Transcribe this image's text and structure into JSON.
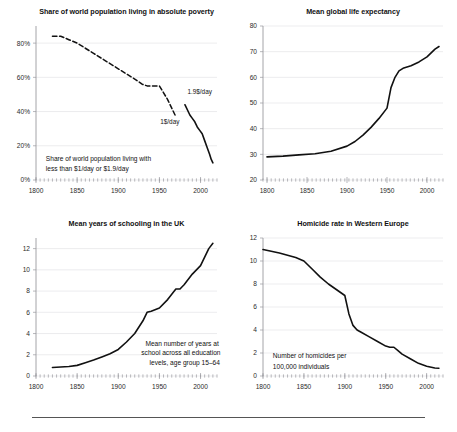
{
  "figure": {
    "name": "four-panel-progress-charts",
    "background": "#ffffff",
    "line_color": "#111111",
    "grid_color": "#d8d8dc",
    "axis_color": "#8d8d93"
  },
  "chart_data": [
    {
      "id": "poverty",
      "type": "line",
      "title": "Share of world population living in absolute poverty",
      "xlabel": "",
      "ylabel": "",
      "xlim": [
        1800,
        2020
      ],
      "ylim": [
        0,
        90
      ],
      "xticks": [
        1800,
        1850,
        1900,
        1950,
        2000
      ],
      "xtick_labels": [
        "1800",
        "1850",
        "1900",
        "1950",
        "2000"
      ],
      "yticks": [
        0,
        20,
        40,
        60,
        80
      ],
      "ytick_labels": [
        "0%",
        "20%",
        "40%",
        "60%",
        "80%"
      ],
      "grid": true,
      "legend": "none",
      "annotations": [
        {
          "text": "1.9$/day",
          "x": 1984,
          "y": 50
        },
        {
          "text": "1$/day",
          "x": 1951,
          "y": 33
        },
        {
          "text": "Share of world population living with",
          "x": 1812,
          "y": 11
        },
        {
          "text": "less than $1/day or $1.9/day",
          "x": 1812,
          "y": 5.5
        }
      ],
      "series": [
        {
          "name": "1$/day",
          "style": "dashed",
          "x": [
            1820,
            1830,
            1840,
            1850,
            1860,
            1870,
            1880,
            1890,
            1900,
            1910,
            1920,
            1929,
            1935,
            1940,
            1950,
            1960,
            1970
          ],
          "values": [
            84,
            84,
            82,
            80,
            77,
            74,
            71,
            68,
            65,
            62,
            59,
            56,
            55,
            55,
            55,
            47,
            37
          ]
        },
        {
          "name": "1.9$/day",
          "style": "solid",
          "x": [
            1981,
            1987,
            1990,
            1993,
            1996,
            1999,
            2002,
            2005,
            2008,
            2011,
            2013,
            2015
          ],
          "values": [
            44,
            38,
            36,
            34,
            31,
            29,
            27,
            23,
            19,
            15,
            12,
            10
          ]
        }
      ]
    },
    {
      "id": "life-expectancy",
      "type": "line",
      "title": "Mean global life expectancy",
      "xlabel": "",
      "ylabel": "",
      "xlim": [
        1795,
        2020
      ],
      "ylim": [
        20,
        80
      ],
      "xticks": [
        1800,
        1850,
        1900,
        1950,
        2000
      ],
      "xtick_labels": [
        "1800",
        "1850",
        "1900",
        "1950",
        "2000"
      ],
      "yticks": [
        20,
        30,
        40,
        50,
        60,
        70,
        80
      ],
      "ytick_labels": [
        "20",
        "30",
        "40",
        "50",
        "60",
        "70",
        "80"
      ],
      "grid": true,
      "legend": "none",
      "annotations": [],
      "series": [
        {
          "name": "life expectancy",
          "style": "solid",
          "x": [
            1800,
            1820,
            1840,
            1860,
            1880,
            1900,
            1910,
            1920,
            1930,
            1940,
            1950,
            1955,
            1960,
            1965,
            1970,
            1980,
            1990,
            2000,
            2010,
            2015
          ],
          "values": [
            29,
            29.3,
            29.8,
            30.2,
            31.2,
            33.2,
            35,
            37.5,
            40.5,
            44,
            48,
            56,
            60,
            62.5,
            63.5,
            64.5,
            66,
            68,
            71,
            72
          ]
        }
      ]
    },
    {
      "id": "schooling",
      "type": "line",
      "title": "Mean years of schooling in the UK",
      "xlabel": "",
      "ylabel": "",
      "xlim": [
        1800,
        2020
      ],
      "ylim": [
        0,
        13
      ],
      "xticks": [
        1800,
        1850,
        1900,
        1950,
        2000
      ],
      "xtick_labels": [
        "1800",
        "1850",
        "1900",
        "1950",
        "2000"
      ],
      "yticks": [
        0,
        2,
        4,
        6,
        8,
        10,
        12
      ],
      "ytick_labels": [
        "0",
        "2",
        "4",
        "6",
        "8",
        "10",
        "12"
      ],
      "grid": true,
      "legend": "none",
      "annotations": [
        {
          "text": "Mean number of years  at",
          "x": 1933,
          "y": 2.85
        },
        {
          "text": "school across all education",
          "x": 1928,
          "y": 1.95
        },
        {
          "text": "levels, age group 15–64",
          "x": 1938,
          "y": 1.05
        }
      ],
      "series": [
        {
          "name": "mean years of schooling",
          "style": "solid",
          "x": [
            1820,
            1830,
            1840,
            1850,
            1860,
            1870,
            1880,
            1890,
            1900,
            1910,
            1920,
            1930,
            1935,
            1940,
            1950,
            1960,
            1965,
            1970,
            1975,
            1980,
            1990,
            2000,
            2010,
            2015
          ],
          "values": [
            0.8,
            0.85,
            0.9,
            1.0,
            1.25,
            1.5,
            1.8,
            2.1,
            2.5,
            3.2,
            4.0,
            5.2,
            6.0,
            6.1,
            6.4,
            7.2,
            7.7,
            8.2,
            8.2,
            8.6,
            9.6,
            10.4,
            12.0,
            12.5
          ]
        }
      ]
    },
    {
      "id": "homicide",
      "type": "line",
      "title": "Homicide rate in Western Europe",
      "xlabel": "",
      "ylabel": "",
      "xlim": [
        1800,
        2020
      ],
      "ylim": [
        0,
        12
      ],
      "xticks": [
        1800,
        1850,
        1900,
        1950,
        2000
      ],
      "xtick_labels": [
        "1800",
        "1850",
        "1900",
        "1950",
        "2000"
      ],
      "yticks": [
        0,
        2,
        4,
        6,
        8,
        10,
        12
      ],
      "ytick_labels": [
        "0",
        "2",
        "4",
        "6",
        "8",
        "10",
        "12"
      ],
      "grid": true,
      "legend": "none",
      "annotations": [
        {
          "text": "Number of homicides per",
          "x": 1812,
          "y": 1.55
        },
        {
          "text": "100,000 individuals",
          "x": 1812,
          "y": 0.65
        }
      ],
      "series": [
        {
          "name": "homicide rate",
          "style": "solid",
          "x": [
            1800,
            1820,
            1840,
            1850,
            1860,
            1870,
            1880,
            1890,
            1900,
            1905,
            1910,
            1915,
            1920,
            1930,
            1940,
            1950,
            1955,
            1960,
            1965,
            1970,
            1980,
            1990,
            2000,
            2010,
            2015
          ],
          "values": [
            11.0,
            10.7,
            10.3,
            10.0,
            9.3,
            8.6,
            8.0,
            7.5,
            7.0,
            5.4,
            4.4,
            4.0,
            3.8,
            3.4,
            3.0,
            2.6,
            2.5,
            2.5,
            2.2,
            1.9,
            1.5,
            1.1,
            0.85,
            0.7,
            0.68
          ]
        }
      ]
    }
  ]
}
